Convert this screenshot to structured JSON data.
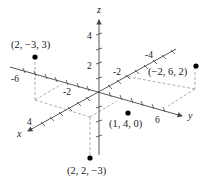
{
  "diagram": {
    "type": "3d-coordinate-plot",
    "axes": {
      "x": {
        "label": "x",
        "ticks": [
          {
            "label": "4"
          },
          {
            "label": "-2"
          },
          {
            "label": "-4"
          }
        ]
      },
      "y": {
        "label": "y",
        "ticks": [
          {
            "label": "-6"
          },
          {
            "label": "-2"
          },
          {
            "label": "6"
          }
        ]
      },
      "z": {
        "label": "z",
        "ticks": [
          {
            "label": "4"
          },
          {
            "label": "2"
          }
        ]
      }
    },
    "points": [
      {
        "label": "(2, −3, 3)",
        "coords": [
          2,
          -3,
          3
        ]
      },
      {
        "label": "(−2, 6, 2)",
        "coords": [
          -2,
          6,
          2
        ]
      },
      {
        "label": "(1, 4, 0)",
        "coords": [
          1,
          4,
          0
        ]
      },
      {
        "label": "(2, 2, −3)",
        "coords": [
          2,
          2,
          -3
        ]
      }
    ]
  }
}
